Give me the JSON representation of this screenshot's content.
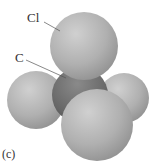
{
  "figure": {
    "caption_label": "(c)",
    "type": "space-filling molecular model",
    "molecule": "CCl4",
    "labels": {
      "chlorine": "Cl",
      "carbon": "C"
    },
    "colors": {
      "chlorine_atom": "#b3b3b3",
      "carbon_atom": "#6e6e6e",
      "leader_line": "#555555",
      "background": "#ffffff"
    },
    "atoms": [
      {
        "element": "Cl",
        "position": "top",
        "cx": 84,
        "cy": 48,
        "r": 34
      },
      {
        "element": "Cl",
        "position": "left",
        "cx": 36,
        "cy": 100,
        "r": 29
      },
      {
        "element": "Cl",
        "position": "right",
        "cx": 124,
        "cy": 98,
        "r": 25
      },
      {
        "element": "Cl",
        "position": "front",
        "cx": 97,
        "cy": 124,
        "r": 37
      },
      {
        "element": "C",
        "position": "center",
        "cx": 80,
        "cy": 95,
        "r": 28
      }
    ]
  }
}
